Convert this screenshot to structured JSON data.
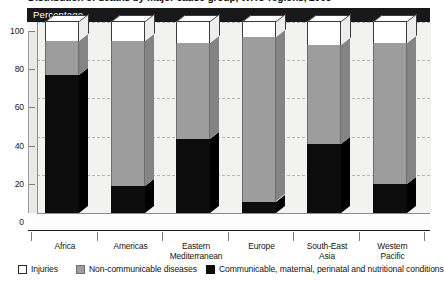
{
  "chart_data": {
    "type": "bar",
    "subtype": "stacked-3d-column",
    "title": "Distribution of deaths by major cause group, WHO regions, 2005",
    "axis_banner": "Percentage",
    "xlabel": "",
    "ylabel": "Percentage",
    "ylim": [
      0,
      100
    ],
    "yticks": [
      100,
      80,
      60,
      40,
      20,
      0
    ],
    "grid": true,
    "grid_style": "dashed-horizontal",
    "legend_position": "bottom",
    "stack_order_bottom_to_top": [
      "Communicable, maternal, perinatal and nutritional conditions",
      "Non-communicable diseases",
      "Injuries"
    ],
    "categories": [
      "Africa",
      "Americas",
      "Eastern Mediterranean",
      "Europe",
      "South-East Asia",
      "Western Pacific"
    ],
    "category_lines": [
      [
        "Africa"
      ],
      [
        "Americas"
      ],
      [
        "Eastern",
        "Mediterranean"
      ],
      [
        "Europe"
      ],
      [
        "South-East",
        "Asia"
      ],
      [
        "Western",
        "Pacific"
      ]
    ],
    "series": [
      {
        "name": "Communicable, maternal, perinatal and nutritional conditions",
        "color": "#0c0c0c",
        "values": [
          72,
          14,
          39,
          6,
          36,
          15
        ]
      },
      {
        "name": "Non-communicable diseases",
        "color": "#9d9d9d",
        "values": [
          18,
          76,
          50,
          86,
          52,
          74
        ]
      },
      {
        "name": "Injuries",
        "color": "#ffffff",
        "values": [
          10,
          10,
          11,
          8,
          12,
          11
        ]
      }
    ]
  },
  "legend": {
    "items": [
      {
        "label": "Injuries",
        "swatch": "white"
      },
      {
        "label": "Non-communicable diseases",
        "swatch": "gray"
      },
      {
        "label": "Communicable, maternal, perinatal and nutritional conditions",
        "swatch": "black"
      }
    ]
  },
  "colors": {
    "banner_bg": "#18181a",
    "banner_text": "#ffffff",
    "black_segment": "#0c0c0c",
    "gray_segment": "#9d9d9d",
    "white_segment": "#ffffff",
    "backwall": "#f2f2f0",
    "gridline": "#b6b6b4"
  }
}
